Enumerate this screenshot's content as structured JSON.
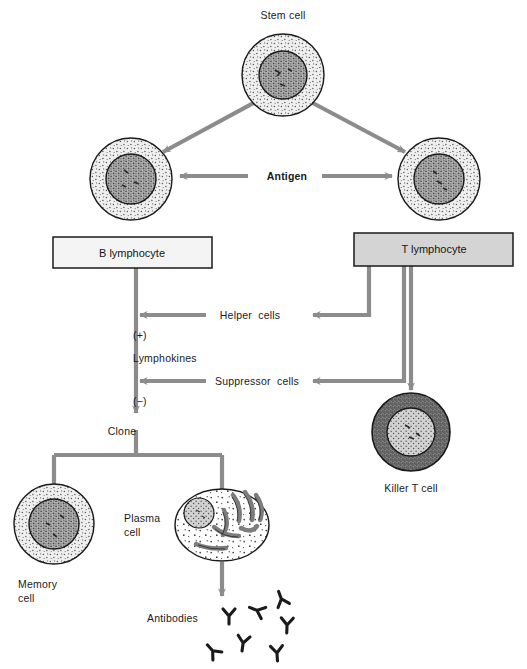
{
  "figure": {
    "background_color": "#ffffff",
    "arrow_color": "#8c8c8c",
    "outline_color": "#1a1a1a",
    "text_color": "#1a1a1a"
  },
  "cells": {
    "stem": {
      "label": "Stem cell",
      "cx": 283,
      "cy": 75,
      "r_outer": 41,
      "r_inner": 24,
      "cytoplasm_color": "#dcdcdc",
      "nucleus_color": "#9a9a9a"
    },
    "b_cell": {
      "label": "",
      "cx": 131,
      "cy": 179,
      "r_outer": 41,
      "r_inner": 25,
      "cytoplasm_color": "#e3e3e3",
      "nucleus_color": "#a0a0a0"
    },
    "t_cell": {
      "label": "",
      "cx": 439,
      "cy": 179,
      "r_outer": 41,
      "r_inner": 25,
      "cytoplasm_color": "#d6d6d6",
      "nucleus_color": "#9c9c9c"
    },
    "killer_t": {
      "label": "Killer T cell",
      "cx": 411,
      "cy": 432,
      "r_outer": 39,
      "r_inner": 24,
      "cytoplasm_color": "#8f8f8f",
      "nucleus_color": "#c9c9c9"
    },
    "memory": {
      "label_line1": "Memory",
      "label_line2": "cell",
      "cx": 54,
      "cy": 524,
      "r_outer": 40,
      "r_inner": 25,
      "cytoplasm_color": "#ededed",
      "nucleus_color": "#9e9e9e"
    },
    "plasma": {
      "label_line1": "Plasma",
      "label_line2": "cell",
      "cx": 222,
      "cy": 525,
      "rx": 47,
      "ry": 36,
      "cytoplasm_color": "#ffffff",
      "nucleus_color": "#d8d8d8",
      "er_color": "#8a8a8a"
    }
  },
  "boxes": {
    "b_lymphocyte": {
      "label": "B lymphocyte",
      "x": 53,
      "y": 237,
      "w": 159,
      "h": 31,
      "fill": "#f4f4f4",
      "stroke": "#1a1a1a"
    },
    "t_lymphocyte": {
      "label": "T lymphocyte",
      "x": 354,
      "y": 233,
      "w": 159,
      "h": 33,
      "fill": "#d4d4d4",
      "stroke": "#1a1a1a"
    }
  },
  "labels": {
    "antigen": "Antigen",
    "helper_cells": "Helper  cells",
    "suppressor_cells": "Suppressor  cells",
    "plus_sign": "(+)",
    "minus_sign": "(−)",
    "lymphokines": "Lymphokines",
    "clone": "Clone",
    "antibodies": "Antibodies"
  },
  "antibodies": {
    "color": "#1a1a1a",
    "count": 8,
    "shape": "Y",
    "positions": [
      {
        "x": 229,
        "y": 617,
        "rot": 0
      },
      {
        "x": 254,
        "y": 611,
        "rot": 115
      },
      {
        "x": 279,
        "y": 598,
        "rot": 155
      },
      {
        "x": 286,
        "y": 626,
        "rot": 0
      },
      {
        "x": 241,
        "y": 645,
        "rot": 10
      },
      {
        "x": 213,
        "y": 650,
        "rot": 135
      },
      {
        "x": 276,
        "y": 654,
        "rot": 0
      }
    ]
  }
}
